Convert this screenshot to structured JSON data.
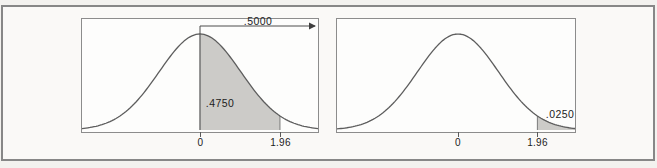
{
  "figure": {
    "left_chart": {
      "arrow_label": ".5000",
      "area_label": ".4750",
      "tick_labels": [
        "0",
        "1.96"
      ]
    },
    "right_chart": {
      "area_label": ".0250",
      "tick_labels": [
        "0",
        "1.96"
      ]
    }
  },
  "chart_data": [
    {
      "type": "area",
      "curve": "standard-normal-density",
      "x_range": [
        -2.9,
        2.9
      ],
      "x_axis_ticks": [
        0,
        1.96
      ],
      "x_tick_labels": [
        "0",
        "1.96"
      ],
      "grid": false,
      "shaded_regions": [
        {
          "from": 0,
          "to": 1.96,
          "area": 0.475,
          "label": ".4750"
        }
      ],
      "annotations": [
        {
          "type": "arrow",
          "label": ".5000",
          "from": 0,
          "to": "plot-right-edge",
          "area": 0.5
        }
      ]
    },
    {
      "type": "area",
      "curve": "standard-normal-density",
      "x_range": [
        -3.0,
        2.9
      ],
      "x_axis_ticks": [
        0,
        1.96
      ],
      "x_tick_labels": [
        "0",
        "1.96"
      ],
      "grid": false,
      "shaded_regions": [
        {
          "from": 1.96,
          "to": 3.0,
          "area": 0.025,
          "label": ".0250"
        }
      ],
      "annotations": []
    }
  ]
}
